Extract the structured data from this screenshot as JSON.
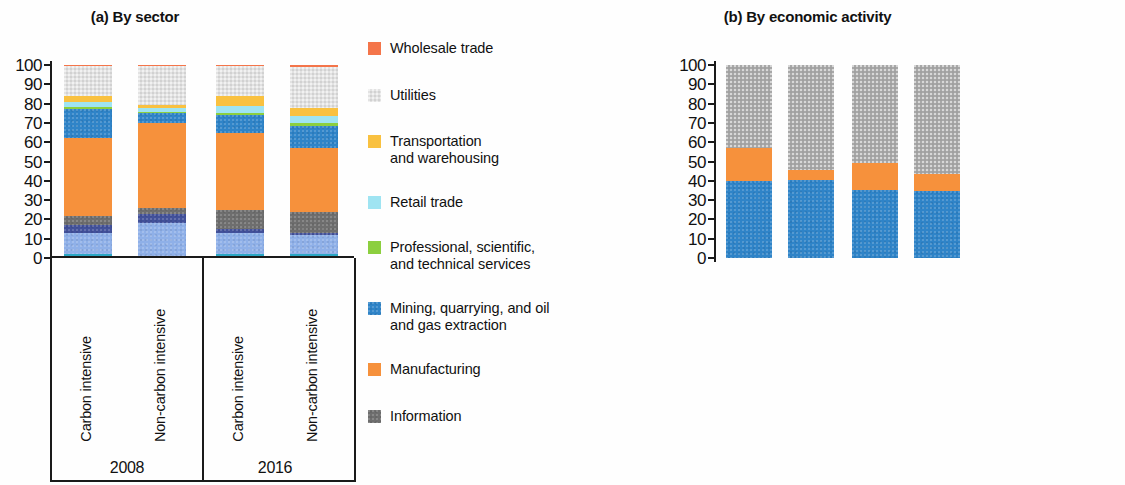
{
  "figure": {
    "panels": [
      {
        "id": "a",
        "title": "(a) By sector"
      },
      {
        "id": "b",
        "title": "(b) By economic activity"
      }
    ]
  },
  "axis": {
    "ticks": [
      "100",
      "90",
      "80",
      "70",
      "60",
      "50",
      "40",
      "30",
      "20",
      "10",
      "0"
    ],
    "min": 0,
    "max": 100
  },
  "groups": {
    "years": [
      "2008",
      "2016"
    ],
    "categories": [
      "Carbon intensive",
      "Non-carbon intensive"
    ]
  },
  "legend_a": [
    {
      "label": "Wholesale trade",
      "color": "#f4754a",
      "texture": "solid"
    },
    {
      "label": "Utilities",
      "color": "#e2e2e2",
      "texture": "dot"
    },
    {
      "label": "Transportation\nand warehousing",
      "color": "#f9c залив"
    },
    {
      "label": "Retail trade",
      "color": "#9fe4f2",
      "texture": "solid"
    },
    {
      "label": "Professional, scientific,\nand technical services",
      "color": "#8ccf3f",
      "texture": "solid"
    },
    {
      "label": "Mining, quarrying, and oil\nand gas extraction",
      "color": "#2f84c8",
      "texture": "noise"
    },
    {
      "label": "Manufacturing",
      "color": "#f6913c",
      "texture": "solid"
    },
    {
      "label": "Information",
      "color": "#6e6e6e",
      "texture": "noise"
    }
  ],
  "legend_b": [
    {
      "label": "Tertiary",
      "color": "#a8a8a8",
      "texture": "dot"
    },
    {
      "label": "Primary",
      "color": "#f6913c",
      "texture": "solid"
    },
    {
      "label": "Manufacturing",
      "color": "#2f84c8",
      "texture": "solid"
    }
  ],
  "colors": {
    "wholesale": "#f4754a",
    "utilities": "#e2e2e2",
    "transportation": "#f9c140",
    "retail": "#9fe4f2",
    "professional": "#8ccf3f",
    "mining": "#2f84c8",
    "manufacturing": "#f6913c",
    "information": "#6e6e6e",
    "other_navy": "#42519a",
    "other_periwinkle": "#8fb0e8",
    "other_teal": "#2aa6c4",
    "tertiary": "#a8a8a8",
    "primary": "#f6913c",
    "mfg_b": "#2f84c8"
  },
  "chart_data": [
    {
      "type": "bar",
      "title": "(a) By sector",
      "stacked": true,
      "xlabel": "",
      "ylabel": "",
      "ylim": [
        0,
        100
      ],
      "grid": false,
      "legend_position": "right",
      "categories": [
        "Carbon intensive 2008",
        "Non-carbon intensive 2008",
        "Carbon intensive 2016",
        "Non-carbon intensive 2016"
      ],
      "series": [
        {
          "name": "Other services (teal)",
          "color": "#2aa6c4",
          "texture": "solid",
          "values": [
            2,
            1,
            2,
            2
          ]
        },
        {
          "name": "Other (periwinkle)",
          "color": "#8fb0e8",
          "texture": "noise",
          "values": [
            11,
            17,
            11,
            10
          ]
        },
        {
          "name": "Other (navy)",
          "color": "#42519a",
          "texture": "noise",
          "values": [
            4,
            5,
            2,
            1
          ]
        },
        {
          "name": "Information",
          "color": "#6e6e6e",
          "texture": "noise",
          "values": [
            5,
            3,
            10,
            11
          ]
        },
        {
          "name": "Manufacturing",
          "color": "#f6913c",
          "texture": "solid",
          "values": [
            40,
            44,
            40,
            33
          ]
        },
        {
          "name": "Mining, quarrying, and oil and gas extraction",
          "color": "#2f84c8",
          "texture": "noise",
          "values": [
            15,
            5,
            9,
            11.5
          ]
        },
        {
          "name": "Professional, scientific, and technical services",
          "color": "#8ccf3f",
          "texture": "solid",
          "values": [
            1,
            0.5,
            1,
            1.5
          ]
        },
        {
          "name": "Retail trade",
          "color": "#9fe4f2",
          "texture": "solid",
          "values": [
            3,
            2,
            4,
            3.5
          ]
        },
        {
          "name": "Transportation and warehousing",
          "color": "#f9c140",
          "texture": "solid",
          "values": [
            3,
            2,
            5,
            4
          ]
        },
        {
          "name": "Utilities",
          "color": "#e2e2e2",
          "texture": "dot",
          "values": [
            15.5,
            20,
            15.5,
            21.5
          ]
        },
        {
          "name": "Wholesale trade",
          "color": "#f4754a",
          "texture": "solid",
          "values": [
            0.5,
            0.5,
            0.5,
            1
          ]
        }
      ]
    },
    {
      "type": "bar",
      "title": "(b) By economic activity",
      "stacked": true,
      "xlabel": "",
      "ylabel": "",
      "ylim": [
        0,
        100
      ],
      "grid": false,
      "legend_position": "right",
      "categories": [
        "Carbon intensive 2008",
        "Non-carbon intensive 2008",
        "Carbon intensive 2016",
        "Non-carbon intensive 2016"
      ],
      "series": [
        {
          "name": "Manufacturing",
          "color": "#2f84c8",
          "texture": "noise",
          "values": [
            40,
            40.5,
            35,
            34.5
          ]
        },
        {
          "name": "Primary",
          "color": "#f6913c",
          "texture": "solid",
          "values": [
            17,
            5,
            14,
            9
          ]
        },
        {
          "name": "Tertiary",
          "color": "#a8a8a8",
          "texture": "dot",
          "values": [
            43,
            54.5,
            51,
            56.5
          ]
        }
      ]
    }
  ]
}
